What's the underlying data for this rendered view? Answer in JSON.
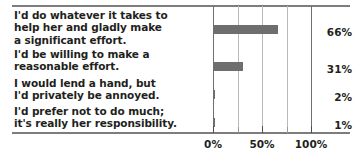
{
  "chart_data": {
    "type": "bar",
    "orientation": "horizontal",
    "title": "",
    "xlabel": "",
    "ylabel": "",
    "xlim": [
      0,
      100
    ],
    "xticks": [
      0,
      25,
      50,
      75,
      100
    ],
    "xticklabels_major": [
      "0%",
      "50%",
      "100%"
    ],
    "grid": true,
    "legend": "none",
    "categories": [
      "I'd do whatever it takes to help her and gladly make a significant effort.",
      "I'd be willing to make a reasonable effort.",
      "I would lend a hand, but I'd privately be annoyed.",
      "I'd prefer not to do much; it's really her responsibility."
    ],
    "values": [
      66,
      31,
      2,
      1
    ],
    "value_labels": [
      "66%",
      "31%",
      "2%",
      "1%"
    ],
    "bar_color": "#6e6e6e",
    "text_color": "#231f20",
    "grid_color": "#b9b9b9",
    "axis_color": "#7d7d7d"
  },
  "labels": [
    {
      "line1": "I'd do whatever it takes to",
      "line2": "help her and gladly make",
      "line3": "a significant effort."
    },
    {
      "line1": "I'd be willing to make a",
      "line2": "reasonable effort.",
      "line3": ""
    },
    {
      "line1": "I would lend a hand, but",
      "line2": "I'd privately be annoyed.",
      "line3": ""
    },
    {
      "line1": "I'd prefer not to do much;",
      "line2": "it's really her responsibility.",
      "line3": ""
    }
  ],
  "axis": {
    "ticks": [
      {
        "value": 0,
        "label": "0%",
        "major": true
      },
      {
        "value": 25,
        "label": "",
        "major": false
      },
      {
        "value": 50,
        "label": "50%",
        "major": true
      },
      {
        "value": 75,
        "label": "",
        "major": false
      },
      {
        "value": 100,
        "label": "100%",
        "major": true
      }
    ]
  }
}
